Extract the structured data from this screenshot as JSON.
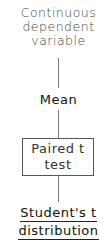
{
  "diagram": {
    "type": "decision-tree",
    "nodes": {
      "root": {
        "lines": [
          "Continuous",
          "dependent",
          "variable"
        ]
      },
      "mean": {
        "label": "Mean"
      },
      "test": {
        "lines": [
          "Paired t",
          "test"
        ],
        "boxed": true
      },
      "distribution": {
        "lines": [
          "Student's t",
          "distribution"
        ],
        "underlined": true
      }
    },
    "edges": [
      [
        "root",
        "mean"
      ],
      [
        "mean",
        "test"
      ],
      [
        "test",
        "distribution"
      ]
    ]
  }
}
